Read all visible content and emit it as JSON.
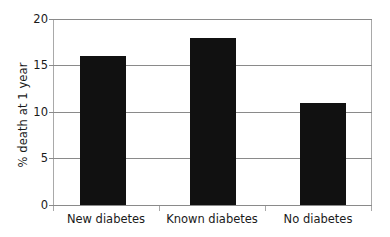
{
  "chart_data": {
    "type": "bar",
    "title": "",
    "subtitle": "",
    "xlabel": "",
    "ylabel": "% death at 1 year",
    "categories": [
      "New diabetes",
      "Known diabetes",
      "No diabetes"
    ],
    "values": [
      16,
      18,
      11
    ],
    "ylim": [
      0,
      20
    ],
    "yticks": [
      "0",
      "5",
      "10",
      "15",
      "20"
    ],
    "ytick_values": [
      0,
      5,
      10,
      15,
      20
    ],
    "grid": "horizontal",
    "legend": "none",
    "bar_color": "#111111",
    "gridline_color": "#8a8a8a",
    "axis_color": "#a9a9a9",
    "background_color": "#ffffff"
  }
}
